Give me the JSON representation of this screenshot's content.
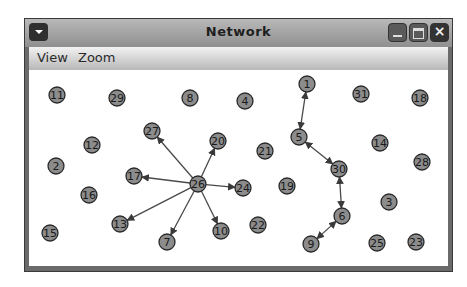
{
  "window": {
    "title": "Network",
    "buttons": {
      "menu": "window-menu",
      "minimize": "minimize",
      "maximize": "maximize",
      "close": "×"
    }
  },
  "menubar": {
    "items": [
      {
        "label": "View"
      },
      {
        "label": "Zoom"
      }
    ]
  },
  "graph": {
    "node_radius": 8,
    "node_fill": "#8c8c8c",
    "node_stroke": "#2a2a2a",
    "edge_color": "#4a4a4a",
    "nodes": [
      {
        "id": "1",
        "x": 307,
        "y": 84
      },
      {
        "id": "2",
        "x": 56,
        "y": 166
      },
      {
        "id": "3",
        "x": 389,
        "y": 202
      },
      {
        "id": "4",
        "x": 245,
        "y": 101
      },
      {
        "id": "5",
        "x": 299,
        "y": 137
      },
      {
        "id": "6",
        "x": 342,
        "y": 216
      },
      {
        "id": "7",
        "x": 167,
        "y": 242
      },
      {
        "id": "8",
        "x": 190,
        "y": 98
      },
      {
        "id": "9",
        "x": 311,
        "y": 244
      },
      {
        "id": "10",
        "x": 221,
        "y": 231
      },
      {
        "id": "11",
        "x": 57,
        "y": 95
      },
      {
        "id": "12",
        "x": 92,
        "y": 145
      },
      {
        "id": "13",
        "x": 120,
        "y": 224
      },
      {
        "id": "14",
        "x": 380,
        "y": 143
      },
      {
        "id": "15",
        "x": 50,
        "y": 233
      },
      {
        "id": "16",
        "x": 89,
        "y": 195
      },
      {
        "id": "17",
        "x": 134,
        "y": 176
      },
      {
        "id": "18",
        "x": 420,
        "y": 98
      },
      {
        "id": "19",
        "x": 287,
        "y": 186
      },
      {
        "id": "20",
        "x": 218,
        "y": 141
      },
      {
        "id": "21",
        "x": 265,
        "y": 151
      },
      {
        "id": "22",
        "x": 258,
        "y": 225
      },
      {
        "id": "23",
        "x": 416,
        "y": 242
      },
      {
        "id": "24",
        "x": 243,
        "y": 188
      },
      {
        "id": "25",
        "x": 377,
        "y": 243
      },
      {
        "id": "26",
        "x": 198,
        "y": 184
      },
      {
        "id": "27",
        "x": 152,
        "y": 131
      },
      {
        "id": "28",
        "x": 422,
        "y": 162
      },
      {
        "id": "29",
        "x": 117,
        "y": 98
      },
      {
        "id": "30",
        "x": 339,
        "y": 169
      },
      {
        "id": "31",
        "x": 361,
        "y": 94
      }
    ],
    "edges": [
      {
        "from": "26",
        "to": "27",
        "bidirectional": false
      },
      {
        "from": "26",
        "to": "20",
        "bidirectional": false
      },
      {
        "from": "26",
        "to": "17",
        "bidirectional": false
      },
      {
        "from": "26",
        "to": "24",
        "bidirectional": false
      },
      {
        "from": "26",
        "to": "13",
        "bidirectional": false
      },
      {
        "from": "26",
        "to": "7",
        "bidirectional": false
      },
      {
        "from": "26",
        "to": "10",
        "bidirectional": false
      },
      {
        "from": "1",
        "to": "5",
        "bidirectional": true
      },
      {
        "from": "5",
        "to": "30",
        "bidirectional": true
      },
      {
        "from": "30",
        "to": "6",
        "bidirectional": true
      },
      {
        "from": "6",
        "to": "9",
        "bidirectional": true
      }
    ]
  }
}
